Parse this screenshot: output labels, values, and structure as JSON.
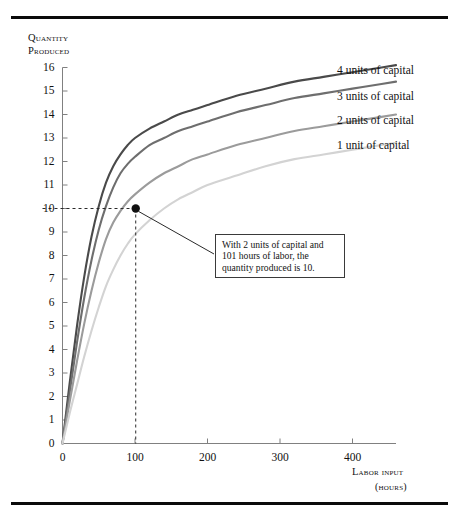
{
  "figure": {
    "y_axis_title_line1": "Quantity",
    "y_axis_title_line2": "Produced",
    "x_axis_title_line1": "Labor input",
    "x_axis_title_line2": "(hours)",
    "annotation": "With 2 units of capital and 101 hours of labor, the quantity produced is 10.",
    "marker_point": {
      "x": 101,
      "y": 10
    }
  },
  "chart_data": {
    "type": "line",
    "title": "",
    "xlabel": "Labor input (hours)",
    "ylabel": "Quantity produced",
    "xlim": [
      0,
      460
    ],
    "ylim": [
      0,
      16
    ],
    "grid": false,
    "legend_position": "right-inline-labels",
    "x_ticks": [
      0,
      100,
      200,
      300,
      400
    ],
    "y_ticks": [
      0,
      1,
      2,
      3,
      4,
      5,
      6,
      7,
      8,
      9,
      10,
      11,
      12,
      13,
      14,
      15,
      16
    ],
    "x": [
      0,
      10,
      20,
      30,
      40,
      50,
      60,
      70,
      80,
      90,
      100,
      120,
      140,
      160,
      180,
      200,
      240,
      280,
      320,
      360,
      400,
      440,
      460
    ],
    "series": [
      {
        "name": "4 units of capital",
        "label": "4 units of capital",
        "color": "#4a4a4a",
        "values": [
          0,
          2.6,
          5.0,
          7.1,
          8.8,
          10.1,
          11.1,
          11.8,
          12.3,
          12.7,
          13.0,
          13.4,
          13.7,
          14.0,
          14.2,
          14.4,
          14.8,
          15.1,
          15.4,
          15.6,
          15.8,
          16.0,
          16.1
        ]
      },
      {
        "name": "3 units of capital",
        "label": "3 units of capital",
        "color": "#6e6e6e",
        "values": [
          0,
          2.2,
          4.3,
          6.2,
          7.8,
          9.1,
          10.1,
          10.9,
          11.5,
          11.9,
          12.2,
          12.7,
          13.0,
          13.3,
          13.5,
          13.7,
          14.1,
          14.4,
          14.7,
          14.9,
          15.1,
          15.3,
          15.4
        ]
      },
      {
        "name": "2 units of capital",
        "label": "2 units of capital",
        "color": "#9b9b9b",
        "values": [
          0,
          1.8,
          3.5,
          5.1,
          6.5,
          7.7,
          8.7,
          9.4,
          9.9,
          10.3,
          10.6,
          11.1,
          11.5,
          11.8,
          12.1,
          12.3,
          12.7,
          13.0,
          13.3,
          13.5,
          13.7,
          13.9,
          14.0
        ]
      },
      {
        "name": "1 unit of capital",
        "label": "1 unit of capital",
        "color": "#d3d3d3",
        "values": [
          0,
          1.3,
          2.5,
          3.7,
          4.8,
          5.8,
          6.7,
          7.4,
          8.0,
          8.5,
          8.9,
          9.5,
          10.0,
          10.4,
          10.7,
          11.0,
          11.4,
          11.8,
          12.1,
          12.3,
          12.5,
          12.7,
          12.8
        ]
      }
    ],
    "annotations": [
      {
        "text": "With 2 units of capital and 101 hours of labor, the quantity produced is 10.",
        "point": {
          "x": 101,
          "y": 10
        }
      }
    ]
  }
}
